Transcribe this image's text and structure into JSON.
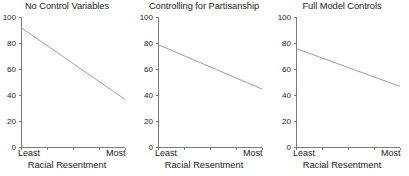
{
  "figure": {
    "background_color": "#ffffff",
    "axis_color": "#6d6d6d",
    "line_color": "#8a8a8a",
    "text_color": "#1c1c1c"
  },
  "chart_data": [
    {
      "type": "line",
      "title": "No Control Variables",
      "xlabel": "Racial Resentment",
      "ylabel": "",
      "xlim": [
        0,
        1
      ],
      "ylim": [
        0,
        100
      ],
      "grid": false,
      "legend": "none",
      "xtick_labels": [
        "Least",
        "Most"
      ],
      "xtick_count": 5,
      "ytick_labels": [
        "0",
        "20",
        "40",
        "60",
        "80",
        "100"
      ],
      "ytick_values": [
        0,
        20,
        40,
        60,
        80,
        100
      ],
      "x": [
        0,
        1
      ],
      "values": [
        92,
        37
      ]
    },
    {
      "type": "line",
      "title": "Controlling for Partisanship",
      "xlabel": "Racial Resentment",
      "ylabel": "",
      "xlim": [
        0,
        1
      ],
      "ylim": [
        0,
        100
      ],
      "grid": false,
      "legend": "none",
      "xtick_labels": [
        "Least",
        "Most"
      ],
      "xtick_count": 5,
      "ytick_labels": [
        "0",
        "20",
        "40",
        "60",
        "80",
        "100"
      ],
      "ytick_values": [
        0,
        20,
        40,
        60,
        80,
        100
      ],
      "x": [
        0,
        1
      ],
      "values": [
        79,
        45
      ]
    },
    {
      "type": "line",
      "title": "Full Model Controls",
      "xlabel": "Racial Resentment",
      "ylabel": "",
      "xlim": [
        0,
        1
      ],
      "ylim": [
        0,
        100
      ],
      "grid": false,
      "legend": "none",
      "xtick_labels": [
        "Least",
        "Most"
      ],
      "xtick_count": 5,
      "ytick_labels": [
        "0",
        "20",
        "40",
        "60",
        "80",
        "100"
      ],
      "ytick_values": [
        0,
        20,
        40,
        60,
        80,
        100
      ],
      "x": [
        0,
        1
      ],
      "values": [
        76,
        47
      ]
    }
  ]
}
